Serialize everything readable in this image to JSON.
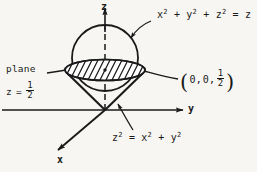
{
  "figure": {
    "background_color": "#f7f6f2",
    "ink_color": "#1a1a1a",
    "axes": {
      "z_label": "z",
      "y_label": "y",
      "x_label": "x"
    },
    "labels": {
      "sphere_equation": {
        "base": "x",
        "full_text": "x2 + y2 + z2 = z",
        "t1": "x",
        "e1": "2",
        "op1": "+",
        "t2": "y",
        "e2": "2",
        "op2": "+",
        "t3": "z",
        "e3": "2",
        "eq": "=",
        "rhs": "z"
      },
      "cone_equation": {
        "full_text": "z2 = x2 + y2",
        "t1": "z",
        "e1": "2",
        "eq": "=",
        "t2": "x",
        "e2": "2",
        "op": "+",
        "t3": "y",
        "e3": "2"
      },
      "plane_label": {
        "word": "plane",
        "var": "z",
        "eq": "=",
        "numerator": "1",
        "denominator": "2"
      },
      "point_label": {
        "open": "(",
        "c1": "0,",
        "c2": "0,",
        "numerator": "1",
        "denominator": "2",
        "close": ")"
      }
    }
  }
}
